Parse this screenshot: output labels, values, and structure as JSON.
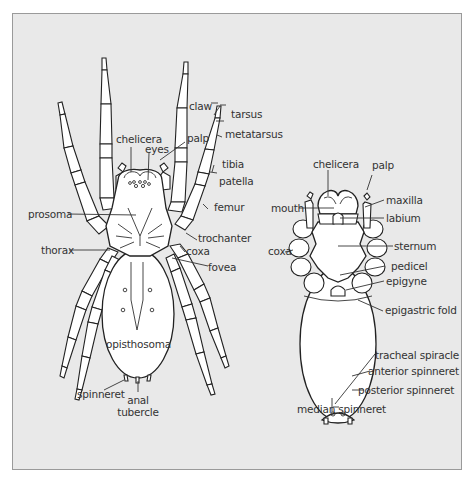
{
  "figure": {
    "background": "#e9e9e9",
    "border_color": "#9a9a9a",
    "line_color": "#222222",
    "fill_color": "#ffffff"
  },
  "dorsal_view": {
    "labels": {
      "claw": "claw",
      "tarsus": "tarsus",
      "metatarsus": "metatarsus",
      "tibia": "tibia",
      "patella": "patella",
      "femur": "femur",
      "chelicera": "chelicera",
      "eyes": "eyes",
      "palp": "palp",
      "prosoma": "prosoma",
      "trochanter": "trochanter",
      "coxa": "coxa",
      "thorax": "thorax",
      "fovea": "fovea",
      "opisthosoma": "opisthosoma",
      "spinneret": "spinneret",
      "anal_tubercle_line1": "anal",
      "anal_tubercle_line2": "tubercle"
    }
  },
  "ventral_view": {
    "labels": {
      "chelicera": "chelicera",
      "palp": "palp",
      "mouth": "mouth",
      "maxilla": "maxilla",
      "labium": "labium",
      "coxa": "coxa",
      "sternum": "sternum",
      "pedicel": "pedicel",
      "epigyne": "epigyne",
      "epigastric_fold": "epigastric fold",
      "tracheal_spiracle": "tracheal spiracle",
      "anterior_spinneret": "anterior spinneret",
      "posterior_spinneret": "posterior spinneret",
      "median_spinneret": "median spinneret"
    }
  }
}
